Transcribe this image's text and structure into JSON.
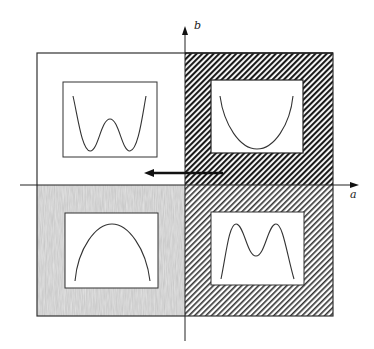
{
  "diagram": {
    "axes": {
      "horizontal_label": "a",
      "vertical_label": "b"
    },
    "quadrants": [
      {
        "position": "top-left",
        "fill": "white",
        "curve": "double-well (W shape)"
      },
      {
        "position": "top-right",
        "fill": "dense-diagonal-hatch",
        "curve": "single-well (U shape)"
      },
      {
        "position": "bottom-left",
        "fill": "gray-stipple",
        "curve": "inverted parabola (∩ shape)"
      },
      {
        "position": "bottom-right",
        "fill": "diagonal-hatch",
        "curve": "double-hump (M shape)"
      }
    ],
    "arrow": {
      "direction": "left",
      "description": "transition arrow along a-axis just above origin"
    },
    "colors": {
      "line": "#222222",
      "hatch_dense": "#1a1a1a",
      "hatch_light": "#333333",
      "stipple": "#c8c8c8",
      "background": "#ffffff"
    }
  }
}
